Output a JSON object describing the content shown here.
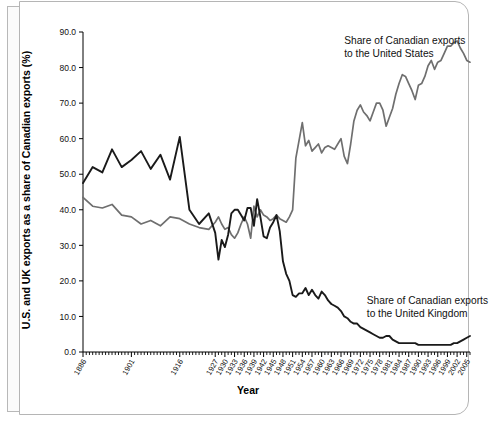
{
  "chart_data": {
    "type": "line",
    "title": "",
    "xlabel": "Year",
    "ylabel": "U.S. and UK exports as a share of Canadian exports (%)",
    "xlim": [
      1886,
      2006
    ],
    "ylim": [
      0.0,
      90.0
    ],
    "grid": false,
    "legend_position": "inline-annotations",
    "ytick_labels": [
      "0.0",
      "10.0",
      "20.0",
      "30.0",
      "40.0",
      "50.0",
      "60.0",
      "70.0",
      "80.0",
      "90.0"
    ],
    "ytick_values": [
      0,
      10,
      20,
      30,
      40,
      50,
      60,
      70,
      80,
      90
    ],
    "xtick_labels": [
      "1886",
      "1901",
      "1916",
      "1927",
      "1930",
      "1933",
      "1936",
      "1939",
      "1942",
      "1945",
      "1948",
      "1951",
      "1954",
      "1957",
      "1960",
      "1963",
      "1966",
      "1969",
      "1972",
      "1975",
      "1978",
      "1981",
      "1984",
      "1987",
      "1990",
      "1993",
      "1996",
      "1999",
      "2002",
      "2005"
    ],
    "xtick_values": [
      1886,
      1901,
      1916,
      1927,
      1930,
      1933,
      1936,
      1939,
      1942,
      1945,
      1948,
      1951,
      1954,
      1957,
      1960,
      1963,
      1966,
      1969,
      1972,
      1975,
      1978,
      1981,
      1984,
      1987,
      1990,
      1993,
      1996,
      1999,
      2002,
      2005
    ],
    "annotations": [
      {
        "name": "us-series-label",
        "line1": "Share of Canadian exports",
        "line2": "to the United States",
        "x": 1967,
        "y": 86.5
      },
      {
        "name": "uk-series-label",
        "line1": "Share of Canadian exports",
        "line2": "to the United Kingdom",
        "x": 1974,
        "y": 13.5
      }
    ],
    "colors": {
      "us_line": "#6f6f6f",
      "uk_line": "#1a1a1a",
      "axis": "#000000",
      "background": "#ffffff"
    },
    "series": [
      {
        "name": "Share of Canadian exports to the United States",
        "color": "#6f6f6f",
        "x": [
          1886,
          1889,
          1892,
          1895,
          1898,
          1901,
          1904,
          1907,
          1910,
          1913,
          1916,
          1919,
          1922,
          1925,
          1927,
          1928,
          1929,
          1930,
          1931,
          1932,
          1933,
          1934,
          1935,
          1936,
          1937,
          1938,
          1939,
          1940,
          1941,
          1942,
          1943,
          1944,
          1945,
          1946,
          1947,
          1948,
          1949,
          1950,
          1951,
          1952,
          1953,
          1954,
          1955,
          1956,
          1957,
          1958,
          1959,
          1960,
          1961,
          1962,
          1963,
          1964,
          1965,
          1966,
          1967,
          1968,
          1969,
          1970,
          1971,
          1972,
          1973,
          1974,
          1975,
          1976,
          1977,
          1978,
          1979,
          1980,
          1981,
          1982,
          1983,
          1984,
          1985,
          1986,
          1987,
          1988,
          1989,
          1990,
          1991,
          1992,
          1993,
          1994,
          1995,
          1996,
          1997,
          1998,
          1999,
          2000,
          2001,
          2002,
          2003,
          2004,
          2005,
          2006
        ],
        "y": [
          43.5,
          41.0,
          40.5,
          41.5,
          38.5,
          38.0,
          36.0,
          37.0,
          35.5,
          38.0,
          37.5,
          36.0,
          35.0,
          34.5,
          36.5,
          38.0,
          36.0,
          34.5,
          35.0,
          33.0,
          32.0,
          33.5,
          36.0,
          38.0,
          36.0,
          32.0,
          41.0,
          38.0,
          40.0,
          38.5,
          38.0,
          37.0,
          37.5,
          38.5,
          37.5,
          37.0,
          36.5,
          38.0,
          40.0,
          54.5,
          59.5,
          64.5,
          58.0,
          59.5,
          56.5,
          57.5,
          58.5,
          56.0,
          57.5,
          58.0,
          57.5,
          57.0,
          58.5,
          60.0,
          55.0,
          53.0,
          58.5,
          65.0,
          68.0,
          69.5,
          67.5,
          66.5,
          65.0,
          67.5,
          70.0,
          70.0,
          68.0,
          63.5,
          66.0,
          68.5,
          72.5,
          75.5,
          78.0,
          77.5,
          75.5,
          73.5,
          71.0,
          75.0,
          75.5,
          77.5,
          80.5,
          82.0,
          79.5,
          81.5,
          82.0,
          84.0,
          86.0,
          86.0,
          87.0,
          87.5,
          85.5,
          84.0,
          82.0,
          81.5
        ]
      },
      {
        "name": "Share of Canadian exports to the United Kingdom",
        "color": "#1a1a1a",
        "x": [
          1886,
          1889,
          1892,
          1895,
          1898,
          1901,
          1904,
          1907,
          1910,
          1913,
          1916,
          1919,
          1922,
          1925,
          1927,
          1928,
          1929,
          1930,
          1931,
          1932,
          1933,
          1934,
          1935,
          1936,
          1937,
          1938,
          1939,
          1940,
          1941,
          1942,
          1943,
          1944,
          1945,
          1946,
          1947,
          1948,
          1949,
          1950,
          1951,
          1952,
          1953,
          1954,
          1955,
          1956,
          1957,
          1958,
          1959,
          1960,
          1961,
          1962,
          1963,
          1964,
          1965,
          1966,
          1967,
          1968,
          1969,
          1970,
          1971,
          1972,
          1973,
          1974,
          1975,
          1976,
          1977,
          1978,
          1979,
          1980,
          1981,
          1982,
          1983,
          1984,
          1985,
          1986,
          1987,
          1988,
          1989,
          1990,
          1991,
          1992,
          1993,
          1994,
          1995,
          1996,
          1997,
          1998,
          1999,
          2000,
          2001,
          2002,
          2003,
          2004,
          2005,
          2006
        ],
        "y": [
          47.5,
          52.0,
          50.5,
          57.0,
          52.0,
          54.0,
          56.5,
          51.5,
          55.5,
          48.5,
          60.5,
          40.0,
          36.0,
          39.0,
          33.5,
          26.0,
          31.5,
          29.5,
          33.0,
          39.0,
          40.0,
          40.0,
          38.5,
          37.0,
          40.5,
          40.5,
          35.5,
          43.0,
          38.0,
          32.5,
          32.0,
          35.0,
          36.5,
          38.5,
          34.0,
          25.5,
          22.0,
          20.0,
          16.0,
          15.5,
          16.5,
          16.5,
          18.0,
          16.0,
          17.5,
          16.0,
          15.0,
          17.0,
          16.0,
          14.5,
          13.5,
          13.0,
          12.5,
          11.5,
          10.0,
          9.5,
          8.5,
          8.0,
          8.0,
          7.0,
          6.5,
          6.0,
          5.5,
          5.0,
          4.5,
          4.0,
          4.0,
          4.5,
          4.5,
          3.5,
          3.0,
          2.5,
          2.5,
          2.5,
          2.5,
          2.5,
          2.5,
          2.0,
          2.0,
          2.0,
          2.0,
          2.0,
          2.0,
          2.0,
          2.0,
          2.0,
          2.0,
          2.0,
          2.5,
          2.5,
          3.0,
          3.5,
          4.0,
          4.5
        ]
      }
    ]
  }
}
